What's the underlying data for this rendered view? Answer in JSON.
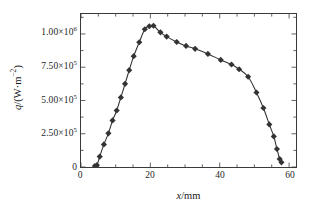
{
  "chart_data": {
    "type": "line",
    "title": "",
    "subtitle": "",
    "xlabel": "x/mm",
    "ylabel": "q/(W·m⁻²)",
    "xlabel_variable": "x",
    "xlabel_unit": "/mm",
    "ylabel_variable": "q",
    "ylabel_unit": "/(W·m⁻²)",
    "xlim": [
      0,
      62
    ],
    "ylim": [
      0,
      1150000
    ],
    "grid": false,
    "legend": null,
    "legend_position": "none",
    "marker": "diamond",
    "marker_color": "#333333",
    "line_color": "#333333",
    "xticks": [
      0,
      20,
      40,
      60
    ],
    "xtick_labels": [
      "0",
      "20",
      "40",
      "60"
    ],
    "xminor_tick_interval": 5,
    "yticks": [
      0,
      250000,
      500000,
      750000,
      1000000
    ],
    "ytick_labels": [
      "0",
      "2.50×10⁵",
      "5.00×10⁵",
      "7.50×10⁵",
      "1.00×10⁶"
    ],
    "ytick_label_parts": [
      {
        "mantissa": "0",
        "has_exponent": false,
        "base": "",
        "exponent": ""
      },
      {
        "mantissa": "2.50",
        "has_exponent": true,
        "base": "10",
        "exponent": "5"
      },
      {
        "mantissa": "5.00",
        "has_exponent": true,
        "base": "10",
        "exponent": "5"
      },
      {
        "mantissa": "7.50",
        "has_exponent": true,
        "base": "10",
        "exponent": "5"
      },
      {
        "mantissa": "1.00",
        "has_exponent": true,
        "base": "10",
        "exponent": "6"
      }
    ],
    "yminor_tick_interval": 125000,
    "series": [
      {
        "name": "heat flux",
        "x": [
          4.0,
          4.6,
          5.4,
          6.6,
          7.9,
          9.1,
          10.3,
          11.5,
          12.7,
          13.9,
          15.2,
          16.8,
          18.4,
          19.7,
          20.9,
          22.9,
          24.7,
          27.6,
          30.3,
          32.9,
          36.6,
          40.3,
          43.4,
          45.6,
          48.2,
          50.6,
          52.6,
          54.3,
          55.6,
          56.5,
          57.3,
          57.8
        ],
        "y": [
          8000,
          14000,
          78000,
          170000,
          253000,
          350000,
          425000,
          523000,
          625000,
          728000,
          833000,
          938000,
          1035000,
          1058000,
          1062000,
          1012000,
          980000,
          940000,
          910000,
          888000,
          850000,
          805000,
          770000,
          735000,
          678000,
          560000,
          443000,
          320000,
          230000,
          135000,
          60000,
          35000
        ]
      }
    ]
  }
}
